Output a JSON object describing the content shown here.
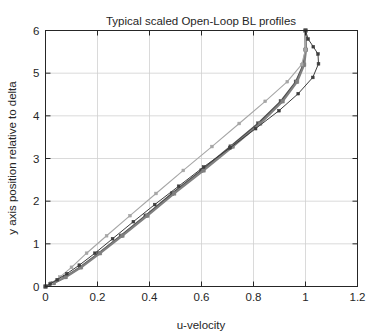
{
  "chart_data": {
    "type": "line",
    "title": "Typical scaled Open-Loop BL profiles",
    "xlabel": "u-velocity",
    "ylabel": "y axis position relative to delta",
    "xlim": [
      0,
      1.2
    ],
    "ylim": [
      0,
      6
    ],
    "xticks": [
      "0",
      "0.2",
      "0.4",
      "0.6",
      "0.8",
      "1",
      "1.2"
    ],
    "xtick_values": [
      0,
      0.2,
      0.4,
      0.6,
      0.8,
      1.0,
      1.2
    ],
    "yticks": [
      "0",
      "1",
      "2",
      "3",
      "4",
      "5",
      "6"
    ],
    "ytick_values": [
      0,
      1,
      2,
      3,
      4,
      5,
      6
    ],
    "grid": true,
    "legend": "none",
    "marker": "square",
    "series": [
      {
        "name": "profile-1",
        "color": "#4d4d4d",
        "linewidth": 1.8,
        "x": [
          0.0,
          0.03,
          0.075,
          0.133,
          0.205,
          0.29,
          0.385,
          0.487,
          0.6,
          0.712,
          0.818,
          0.905,
          0.963,
          0.992,
          1.0,
          1.0
        ],
        "y": [
          0.0,
          0.08,
          0.22,
          0.45,
          0.78,
          1.19,
          1.66,
          2.18,
          2.72,
          3.28,
          3.82,
          4.34,
          4.8,
          5.2,
          5.55,
          6.0
        ]
      },
      {
        "name": "profile-2",
        "color": "#808080",
        "linewidth": 2.2,
        "x": [
          0.0,
          0.032,
          0.078,
          0.137,
          0.21,
          0.296,
          0.392,
          0.495,
          0.608,
          0.72,
          0.826,
          0.912,
          0.968,
          0.995,
          1.002,
          1.0
        ],
        "y": [
          0.0,
          0.08,
          0.22,
          0.45,
          0.78,
          1.19,
          1.66,
          2.18,
          2.72,
          3.28,
          3.82,
          4.34,
          4.8,
          5.2,
          5.55,
          6.0
        ]
      },
      {
        "name": "profile-3",
        "color": "#a6a6a6",
        "linewidth": 1.1,
        "x": [
          0.0,
          0.022,
          0.055,
          0.1,
          0.158,
          0.235,
          0.325,
          0.425,
          0.53,
          0.64,
          0.745,
          0.845,
          0.93,
          0.985,
          1.0,
          1.0
        ],
        "y": [
          0.0,
          0.08,
          0.22,
          0.45,
          0.78,
          1.19,
          1.66,
          2.18,
          2.72,
          3.28,
          3.82,
          4.34,
          4.8,
          5.2,
          5.55,
          6.0
        ]
      },
      {
        "name": "profile-4",
        "color": "#3d3d3d",
        "linewidth": 1.0,
        "x": [
          0.0,
          0.018,
          0.045,
          0.082,
          0.13,
          0.19,
          0.258,
          0.338,
          0.42,
          0.512,
          0.608,
          0.71,
          0.808,
          0.898,
          0.972,
          1.028,
          1.05,
          1.048,
          1.03,
          1.01,
          1.0
        ],
        "y": [
          0.0,
          0.06,
          0.16,
          0.3,
          0.5,
          0.78,
          1.12,
          1.52,
          1.92,
          2.35,
          2.8,
          3.25,
          3.7,
          4.12,
          4.52,
          4.9,
          5.22,
          5.45,
          5.62,
          5.8,
          6.0
        ]
      }
    ]
  },
  "axes": {
    "frame_color": "#262626",
    "grid_color": "#d0d0d0",
    "background": "#ffffff"
  }
}
